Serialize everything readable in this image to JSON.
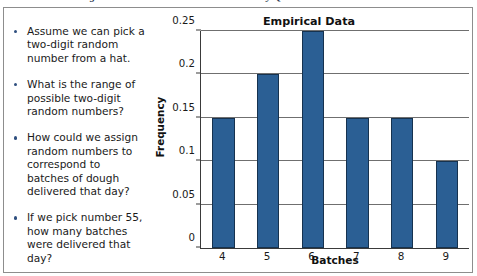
{
  "caption": {
    "text": "FIGURE 9.12   Using Random Numbers to Simulate Delivery Quantities"
  },
  "bullets": [
    {
      "text": "Assume we can pick a two-digit random number from a hat."
    },
    {
      "text": "What is the range of possible two-digit random numbers?"
    },
    {
      "text": "How could we assign random numbers to correspond to batches of dough delivered that day?"
    },
    {
      "text": "If we pick number 55, how many batches were delivered that day?"
    }
  ],
  "colors": {
    "bar_fill": "#2b5f94",
    "bar_stroke": "#16324f",
    "axis": "#3a3a3a",
    "grid": "#6f6f6f",
    "bullet_dot": "#2f4f7f"
  },
  "chart_data": {
    "type": "bar",
    "title": "Empirical Data",
    "xlabel": "Batches",
    "ylabel": "Frequency",
    "categories": [
      "4",
      "5",
      "6",
      "7",
      "8",
      "9"
    ],
    "values": [
      0.15,
      0.2,
      0.25,
      0.15,
      0.15,
      0.1
    ],
    "ylim": [
      0,
      0.25
    ],
    "yticks": [
      0,
      0.05,
      0.1,
      0.15,
      0.2,
      0.25
    ],
    "ytick_labels": [
      "0",
      "0.05",
      "0.1",
      "0.15",
      "0.2",
      "0.25"
    ],
    "grid": true,
    "legend": false
  }
}
